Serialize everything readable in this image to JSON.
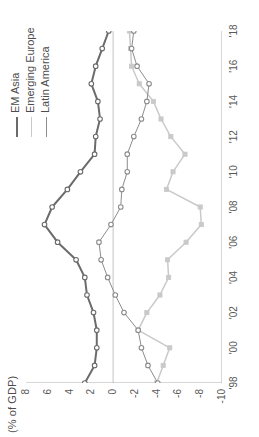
{
  "chart_data": {
    "type": "line",
    "title": "",
    "ylabel": "(% of GDP)",
    "xlabel": "",
    "ylim": [
      -10,
      8
    ],
    "yticks": [
      8,
      6,
      4,
      2,
      0,
      -2,
      -4,
      -6,
      -8,
      -10
    ],
    "ytick_labels": [
      "8",
      "6",
      "4",
      "2",
      "0",
      "-2",
      "-4",
      "-6",
      "-8",
      "-10"
    ],
    "x": [
      1998,
      1999,
      2000,
      2001,
      2002,
      2003,
      2004,
      2005,
      2006,
      2007,
      2008,
      2009,
      2010,
      2011,
      2012,
      2013,
      2014,
      2015,
      2016,
      2017,
      2018
    ],
    "xticks": [
      1998,
      2000,
      2002,
      2004,
      2006,
      2008,
      2010,
      2012,
      2014,
      2016,
      2018
    ],
    "xtick_labels": [
      "'98",
      "'00",
      "'02",
      "'04",
      "'06",
      "'08",
      "'10",
      "'12",
      "'14",
      "'16",
      "'18"
    ],
    "grid": false,
    "zero_line": true,
    "legend_position": "top-right",
    "series": [
      {
        "name": "EM Asia",
        "color": "#6b6b6b",
        "marker": "circle-open",
        "line_width": 2,
        "values": [
          2.6,
          1.7,
          1.5,
          1.5,
          1.8,
          2.4,
          2.6,
          3.4,
          5.1,
          6.3,
          5.6,
          4.2,
          3.0,
          1.7,
          1.6,
          1.2,
          1.4,
          2.0,
          1.6,
          1.0,
          0.4
        ]
      },
      {
        "name": "Emerging Europe",
        "color": "#c9c9c9",
        "marker": "square-filled",
        "line_width": 1.5,
        "values": [
          -4.0,
          -4.6,
          -5.2,
          -2.3,
          -3.1,
          -4.3,
          -5.1,
          -5.0,
          -6.7,
          -8.1,
          -8.0,
          -4.9,
          -5.5,
          -6.6,
          -5.3,
          -4.4,
          -3.7,
          -2.4,
          -1.7,
          -1.6,
          -1.5
        ]
      },
      {
        "name": "Latin America",
        "color": "#8c8c8c",
        "marker": "circle-open",
        "line_width": 1,
        "values": [
          -4.1,
          -3.2,
          -2.6,
          -2.3,
          -1.0,
          -0.2,
          0.5,
          1.1,
          1.3,
          0.2,
          -0.7,
          -0.8,
          -1.3,
          -1.3,
          -1.9,
          -2.6,
          -3.1,
          -3.3,
          -2.2,
          -1.7,
          -1.9
        ]
      }
    ]
  },
  "legend": {
    "items": [
      {
        "label": "EM Asia"
      },
      {
        "label": "Emerging Europe"
      },
      {
        "label": "Latin America"
      }
    ]
  }
}
